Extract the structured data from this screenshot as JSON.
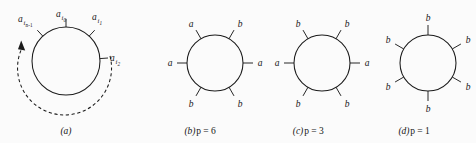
{
  "figure": {
    "background_color": "#fbfbfb",
    "ink_color": "#1b1b1b",
    "panels": [
      {
        "id": "a",
        "caption": "(a)",
        "caption_letter": "a",
        "caption_formula": "",
        "circle": {
          "cx": 66,
          "cy": 61,
          "r": 34
        },
        "ticks": [
          {
            "angle_deg": 90,
            "label_base": "a",
            "label_sub": "i",
            "label_subsub": "0",
            "label_full": "a_i0",
            "label_x": 66,
            "label_y": 16,
            "anchor": "middle"
          },
          {
            "angle_deg": 47,
            "label_base": "a",
            "label_sub": "i",
            "label_subsub": "1",
            "label_full": "a_i1",
            "label_x": 93,
            "label_y": 20,
            "anchor": "start"
          },
          {
            "angle_deg": 133,
            "label_base": "a",
            "label_sub": "i",
            "label_subsub": "n-1",
            "label_full": "a_in-1",
            "label_x": 19,
            "label_y": 26,
            "anchor": "start"
          },
          {
            "angle_deg": 4,
            "label_base": "a",
            "label_sub": "i",
            "label_subsub": "2",
            "label_full": "a_i2",
            "label_x": 111,
            "label_y": 63,
            "anchor": "start"
          }
        ],
        "arrow": {
          "name": "counterclockwise-dashed-arrow",
          "direction": "counterclockwise",
          "style": "dashed",
          "has_arrowhead": true
        }
      },
      {
        "id": "b",
        "caption": "(b)  p = 6",
        "caption_letter": "b",
        "caption_formula": "p = 6",
        "p_value": 6,
        "circle": {
          "cx": 215,
          "cy": 63,
          "r": 28
        },
        "ticks": [
          {
            "angle_deg": 120,
            "label": "a",
            "label_x": 182,
            "label_y": 24,
            "anchor": "middle"
          },
          {
            "angle_deg": 60,
            "label": "b",
            "label_x": 248,
            "label_y": 24,
            "anchor": "middle"
          },
          {
            "angle_deg": 180,
            "label": "a",
            "label_x": 164,
            "label_y": 67,
            "anchor": "middle"
          },
          {
            "angle_deg": 0,
            "label": "a",
            "label_x": 266,
            "label_y": 67,
            "anchor": "middle"
          },
          {
            "angle_deg": 240,
            "label": "b",
            "label_x": 182,
            "label_y": 110,
            "anchor": "middle"
          },
          {
            "angle_deg": 300,
            "label": "b",
            "label_x": 248,
            "label_y": 110,
            "anchor": "middle"
          }
        ]
      },
      {
        "id": "c",
        "caption": "(c)  p = 3",
        "caption_letter": "c",
        "caption_formula": "p = 3",
        "p_value": 3,
        "circle": {
          "cx": 322,
          "cy": 63,
          "r": 28
        },
        "ticks": [
          {
            "angle_deg": 120,
            "label": "b",
            "label_x": 289,
            "label_y": 24,
            "anchor": "middle"
          },
          {
            "angle_deg": 60,
            "label": "b",
            "label_x": 355,
            "label_y": 24,
            "anchor": "middle"
          },
          {
            "angle_deg": 180,
            "label": "a",
            "label_x": 271,
            "label_y": 67,
            "anchor": "middle"
          },
          {
            "angle_deg": 0,
            "label": "a",
            "label_x": 373,
            "label_y": 67,
            "anchor": "middle"
          },
          {
            "angle_deg": 240,
            "label": "b",
            "label_x": 289,
            "label_y": 110,
            "anchor": "middle"
          },
          {
            "angle_deg": 300,
            "label": "b",
            "label_x": 355,
            "label_y": 110,
            "anchor": "middle"
          }
        ]
      },
      {
        "id": "d",
        "caption": "(d)  p = 1",
        "caption_letter": "d",
        "caption_formula": "p = 1",
        "p_value": 1,
        "circle": {
          "cx": 428,
          "cy": 63,
          "r": 28
        },
        "ticks": [
          {
            "angle_deg": 90,
            "label": "b",
            "label_x": 428,
            "label_y": 16,
            "anchor": "middle"
          },
          {
            "angle_deg": 30,
            "label": "b",
            "label_x": 470,
            "label_y": 40,
            "anchor": "middle"
          },
          {
            "angle_deg": 150,
            "label": "b",
            "label_x": 386,
            "label_y": 40,
            "anchor": "middle"
          },
          {
            "angle_deg": 210,
            "label": "b",
            "label_x": 386,
            "label_y": 94,
            "anchor": "middle"
          },
          {
            "angle_deg": 330,
            "label": "b",
            "label_x": 470,
            "label_y": 94,
            "anchor": "middle"
          },
          {
            "angle_deg": 270,
            "label": "b",
            "label_x": 428,
            "label_y": 117,
            "anchor": "middle"
          }
        ]
      }
    ],
    "captions": {
      "a": {
        "letter": "(a)",
        "formula": "",
        "x": 66,
        "y": 134
      },
      "b": {
        "letter": "(b)",
        "formula": "p = 6",
        "x": 198,
        "y": 134
      },
      "c": {
        "letter": "(c)",
        "formula": "p = 3",
        "x": 306,
        "y": 134
      },
      "d": {
        "letter": "(d)",
        "formula": "p = 1",
        "x": 412,
        "y": 134
      }
    }
  }
}
